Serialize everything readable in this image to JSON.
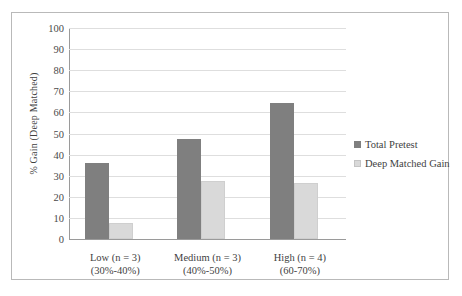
{
  "chart_data": {
    "type": "bar",
    "title": "",
    "xlabel": "",
    "ylabel": "% Gain (Deep Matched)",
    "ylim": [
      0,
      100
    ],
    "ytick_step": 10,
    "yticks": [
      100,
      90,
      80,
      70,
      60,
      50,
      40,
      30,
      20,
      10,
      0
    ],
    "grid": "horizontal",
    "legend_position": "right",
    "categories": [
      "Low (n = 3)",
      "Medium (n = 3)",
      "High (n = 4)"
    ],
    "category_subtitles": [
      "(30%-40%)",
      "(40%-50%)",
      "(60-70%)"
    ],
    "series": [
      {
        "name": "Total Pretest",
        "color": "#7f7f7f",
        "values": [
          36,
          47.5,
          64.5
        ]
      },
      {
        "name": "Deep Matched Gain",
        "color": "#d9d9d9",
        "values": [
          7.5,
          27.5,
          26.5
        ]
      }
    ]
  }
}
